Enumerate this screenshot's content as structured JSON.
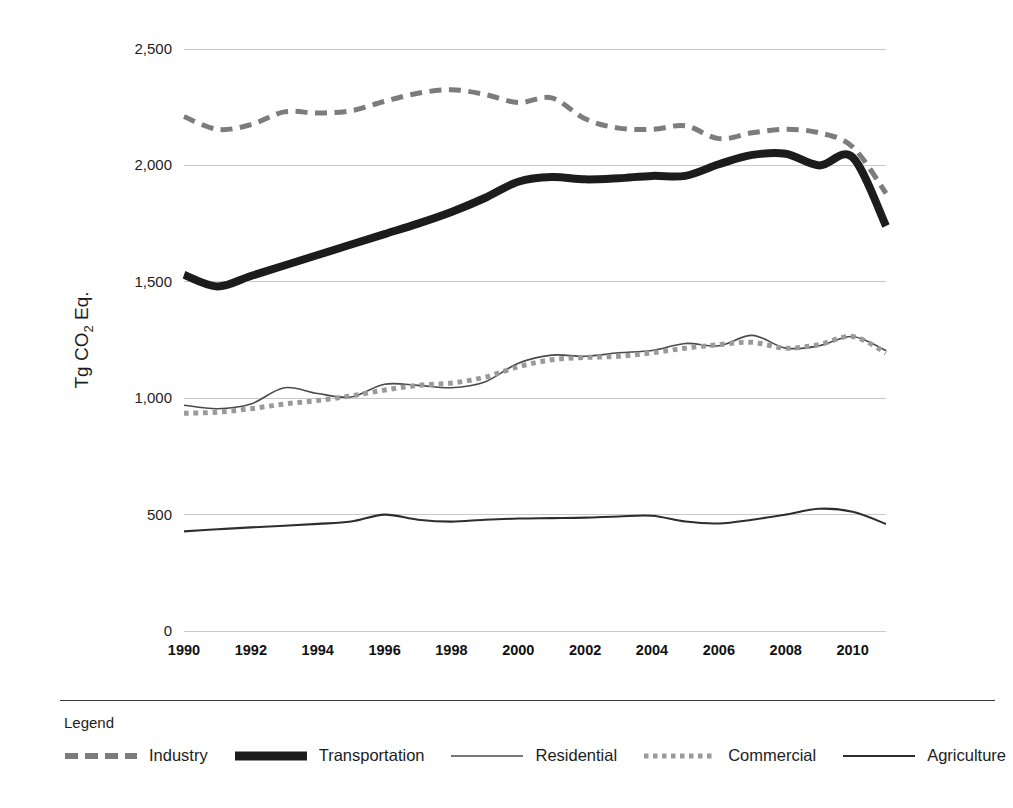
{
  "chart_data": {
    "type": "line",
    "title": "",
    "xlabel": "",
    "ylabel": "Tg CO2 Eq.",
    "ylabel_display": "Tg CO₂ Eq.",
    "xlim": [
      1990,
      2011
    ],
    "ylim": [
      0,
      2500
    ],
    "grid": true,
    "legend_position": "bottom",
    "legend_title": "Legend",
    "x": [
      1990,
      1991,
      1992,
      1993,
      1994,
      1995,
      1996,
      1997,
      1998,
      1999,
      2000,
      2001,
      2002,
      2003,
      2004,
      2005,
      2006,
      2007,
      2008,
      2009,
      2010,
      2011
    ],
    "xticks": [
      "1990",
      "1992",
      "1994",
      "1996",
      "1998",
      "2000",
      "2002",
      "2004",
      "2006",
      "2008",
      "2010"
    ],
    "xtick_values": [
      1990,
      1992,
      1994,
      1996,
      1998,
      2000,
      2002,
      2004,
      2006,
      2008,
      2010
    ],
    "yticks": [
      "0",
      "500",
      "1,000",
      "1,500",
      "2,000",
      "2,500"
    ],
    "ytick_values": [
      0,
      500,
      1000,
      1500,
      2000,
      2500
    ],
    "series": [
      {
        "name": "Industry",
        "style": "dashed",
        "color": "#7c7c7c",
        "width": 5,
        "values": [
          2210,
          2155,
          2175,
          2230,
          2225,
          2235,
          2275,
          2310,
          2325,
          2305,
          2270,
          2290,
          2200,
          2160,
          2155,
          2170,
          2115,
          2140,
          2155,
          2140,
          2080,
          1880
        ]
      },
      {
        "name": "Transportation",
        "style": "thick-solid",
        "color": "#1c1c1c",
        "width": 8,
        "values": [
          1530,
          1480,
          1525,
          1570,
          1615,
          1660,
          1705,
          1750,
          1800,
          1860,
          1930,
          1950,
          1940,
          1945,
          1955,
          1955,
          2005,
          2045,
          2050,
          2000,
          2035,
          1740
        ]
      },
      {
        "name": "Residential",
        "style": "thin-solid",
        "color": "#4a4a4a",
        "width": 1.6,
        "values": [
          970,
          955,
          975,
          1045,
          1020,
          1005,
          1060,
          1055,
          1045,
          1070,
          1150,
          1185,
          1180,
          1195,
          1205,
          1235,
          1225,
          1270,
          1215,
          1225,
          1265,
          1205
        ]
      },
      {
        "name": "Commercial",
        "style": "dotted",
        "color": "#9a9a9a",
        "width": 5,
        "values": [
          935,
          940,
          955,
          975,
          990,
          1010,
          1035,
          1055,
          1065,
          1090,
          1135,
          1165,
          1175,
          1180,
          1195,
          1215,
          1230,
          1240,
          1215,
          1230,
          1265,
          1195
        ]
      },
      {
        "name": "Agriculture",
        "style": "thin-solid",
        "color": "#2e2e2e",
        "width": 2.1,
        "values": [
          428,
          437,
          445,
          452,
          460,
          470,
          500,
          478,
          470,
          478,
          483,
          485,
          487,
          492,
          495,
          470,
          462,
          478,
          500,
          525,
          512,
          460
        ]
      }
    ]
  },
  "legend": {
    "title": "Legend",
    "items": [
      {
        "label": "Industry",
        "style": "dashed",
        "color": "#7c7c7c"
      },
      {
        "label": "Transportation",
        "style": "thick-solid",
        "color": "#1c1c1c"
      },
      {
        "label": "Residential",
        "style": "thin-solid",
        "color": "#4a4a4a"
      },
      {
        "label": "Commercial",
        "style": "dotted",
        "color": "#9a9a9a"
      },
      {
        "label": "Agriculture",
        "style": "thin-solid",
        "color": "#2e2e2e"
      }
    ]
  }
}
